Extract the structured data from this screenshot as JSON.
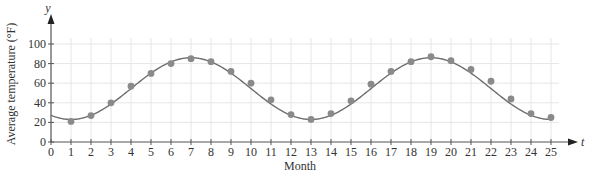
{
  "chart_data": {
    "type": "scatter",
    "title": "",
    "xlabel": "Month",
    "ylabel": "Average temperature (°F)",
    "x_axis_var": "t",
    "y_axis_var": "y",
    "xlim": [
      0,
      25
    ],
    "ylim": [
      0,
      100
    ],
    "x_ticks": [
      0,
      1,
      2,
      3,
      4,
      5,
      6,
      7,
      8,
      9,
      10,
      11,
      12,
      13,
      14,
      15,
      16,
      17,
      18,
      19,
      20,
      21,
      22,
      23,
      24,
      25
    ],
    "y_ticks": [
      0,
      20,
      40,
      60,
      80,
      100
    ],
    "grid": true,
    "legend": null,
    "series": [
      {
        "name": "Observed average temperature",
        "kind": "points",
        "x": [
          1,
          2,
          3,
          4,
          5,
          6,
          7,
          8,
          9,
          10,
          11,
          12,
          13,
          14,
          15,
          16,
          17,
          18,
          19,
          20,
          21,
          22,
          23,
          24,
          25
        ],
        "values": [
          21,
          27,
          40,
          57,
          70,
          80,
          85,
          82,
          72,
          60,
          43,
          28,
          23,
          29,
          42,
          59,
          72,
          82,
          87,
          83,
          74,
          62,
          44,
          29,
          25
        ]
      },
      {
        "name": "Fitted sinusoidal model",
        "kind": "line",
        "model": {
          "mean": 54.5,
          "amplitude": 31.5,
          "period": 12,
          "phase_shift": 4
        },
        "x_range": [
          0,
          25
        ]
      }
    ],
    "colors": {
      "points": "#8a8a8a",
      "curve": "#6f6f6f",
      "grid": "#e6e6e6",
      "axis": "#555555"
    }
  }
}
